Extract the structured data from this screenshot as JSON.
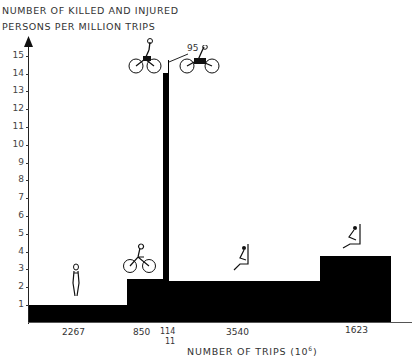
{
  "chart_data": {
    "type": "bar",
    "subtype": "variable-width (area) bar chart",
    "title": "",
    "ylabel": "NUMBER OF KILLED AND INJURED PERSONS PER MILLION TRIPS",
    "xlabel": "NUMBER OF TRIPS (10^6)",
    "ylim": [
      0,
      15
    ],
    "yticks": [
      1,
      2,
      3,
      4,
      5,
      6,
      7,
      8,
      9,
      10,
      11,
      12,
      13,
      14,
      15
    ],
    "grid": false,
    "categories": [
      "Walking",
      "Bicycle",
      "Moped",
      "Light motorcycle",
      "Car driver",
      "Car passenger"
    ],
    "trips_millions": [
      2267,
      850,
      114,
      11,
      3540,
      1623
    ],
    "values": [
      1.0,
      2.5,
      14.0,
      95,
      2.3,
      3.7
    ],
    "annotations": [
      "95"
    ],
    "icons": [
      "pedestrian",
      "cyclist",
      "moped-rider",
      "motorcycle-rider",
      "car-driver",
      "car-passenger"
    ]
  },
  "labels": {
    "ytitle_line1": "NUMBER OF KILLED AND INJURED",
    "ytitle_line2": "PERSONS PER MILLION TRIPS",
    "xtitle": "NUMBER OF TRIPS (10",
    "xtitle_sup": "6",
    "xtitle_end": ")",
    "annotation_95": "95",
    "x_walk": "2267",
    "x_bike": "850",
    "x_moped": "114",
    "x_mc": "11",
    "x_driver": "3540",
    "x_passenger": "1623"
  },
  "yticks": [
    "1",
    "2",
    "3",
    "4",
    "5",
    "6",
    "7",
    "8",
    "9",
    "10",
    "11",
    "12",
    "13",
    "14",
    "15"
  ]
}
